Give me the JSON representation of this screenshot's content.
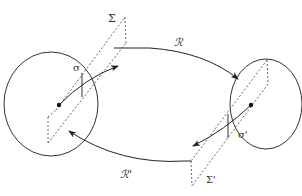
{
  "diagram": {
    "width": 302,
    "height": 196,
    "colors": {
      "stroke": "#333333",
      "dashed": "#555555",
      "background": "#ffffff"
    },
    "labels": {
      "sigma_plane": "Σ",
      "sigma_plane_prime": "Σ'",
      "sigma_section": "σ",
      "sigma_section_prime": "σ'",
      "map_R": "ℛ",
      "map_R_prime": "ℛ'"
    },
    "nodes": [
      {
        "id": "left-region",
        "shape": "circle",
        "cx": 51,
        "cy": 104,
        "rx": 47,
        "ry": 52
      },
      {
        "id": "right-region",
        "shape": "circle",
        "cx": 266,
        "cy": 104,
        "rx": 36,
        "ry": 45
      }
    ],
    "edges": [
      {
        "id": "R",
        "from": "left-region",
        "to": "right-region",
        "label": "ℛ"
      },
      {
        "id": "R-prime",
        "from": "right-region",
        "to": "left-region",
        "label": "ℛ'"
      }
    ]
  }
}
